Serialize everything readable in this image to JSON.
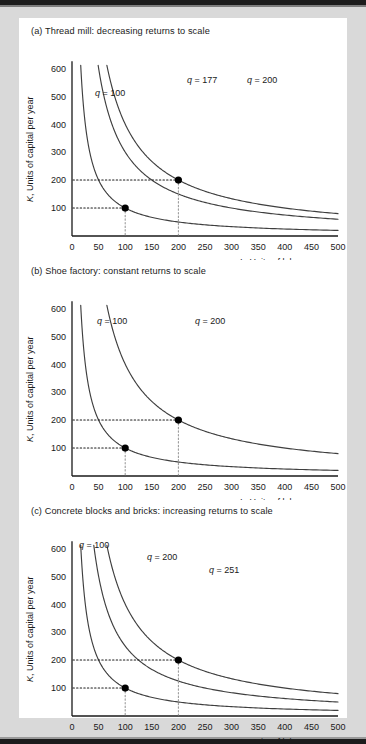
{
  "figure": {
    "background": "#d9d9d9",
    "card_background": "#ffffff",
    "axis_color": "#1a1a1a",
    "curve_color": "#3a3a3a",
    "marker_color": "#000000"
  },
  "axes": {
    "y_label": "K, Units of capital per year",
    "x_label": "L, Units of labor per year",
    "y_ticks": [
      "600",
      "500",
      "400",
      "300",
      "200",
      "100"
    ],
    "x_ticks": [
      "0",
      "50",
      "100",
      "150",
      "200",
      "250",
      "300",
      "350",
      "400",
      "450",
      "500"
    ],
    "xlim": [
      0,
      500
    ],
    "ylim": [
      0,
      640
    ]
  },
  "panels": [
    {
      "id": "a",
      "title": "(a) Thread mill: decreasing returns to scale",
      "curves": [
        {
          "label": "q = 100",
          "q": 100,
          "constant": 10000,
          "lx": 76,
          "ly": 500
        },
        {
          "label": "q = 177",
          "q": 177,
          "constant": 30000,
          "lx": 168,
          "ly": 548
        },
        {
          "label": "q = 200",
          "q": 200,
          "constant": 40000,
          "lx": 228,
          "ly": 548
        }
      ],
      "markers": [
        {
          "x": 100,
          "y": 100
        },
        {
          "x": 200,
          "y": 200
        }
      ]
    },
    {
      "id": "b",
      "title": "(b) Shoe factory: constant returns to scale",
      "curves": [
        {
          "label": "q = 100",
          "q": 100,
          "constant": 10000,
          "lx": 78,
          "ly": 545
        },
        {
          "label": "q = 200",
          "q": 200,
          "constant": 40000,
          "lx": 176,
          "ly": 545
        }
      ],
      "markers": [
        {
          "x": 100,
          "y": 100
        },
        {
          "x": 200,
          "y": 200
        }
      ]
    },
    {
      "id": "c",
      "title": "(c) Concrete blocks and bricks: increasing returns to scale",
      "curves": [
        {
          "label": "q = 100",
          "q": 100,
          "constant": 10000,
          "lx": 60,
          "ly": 600
        },
        {
          "label": "q = 200",
          "q": 200,
          "constant": 25000,
          "lx": 128,
          "ly": 556
        },
        {
          "label": "q = 251",
          "q": 251,
          "constant": 40000,
          "lx": 190,
          "ly": 512
        }
      ],
      "markers": [
        {
          "x": 100,
          "y": 100
        },
        {
          "x": 200,
          "y": 200
        }
      ]
    }
  ],
  "chart_data": {
    "type": "line",
    "xlabel": "L, Units of labor per year",
    "ylabel": "K, Units of capital per year",
    "xlim": [
      0,
      500
    ],
    "ylim": [
      0,
      640
    ],
    "grid": false,
    "legend": "inline curve labels",
    "xticks": [
      0,
      50,
      100,
      150,
      200,
      250,
      300,
      350,
      400,
      450,
      500
    ],
    "yticks": [
      100,
      200,
      300,
      400,
      500,
      600
    ],
    "subplots": [
      {
        "panel": "(a) Thread mill: decreasing returns to scale",
        "series": [
          {
            "name": "q = 100",
            "form": "K = 10000 / L",
            "points_through": [
              [
                100,
                100
              ]
            ]
          },
          {
            "name": "q = 177",
            "form": "K = 30000 / L",
            "points_through": [
              [
                200,
                150
              ]
            ]
          },
          {
            "name": "q = 200",
            "form": "K = 40000 / L",
            "points_through": [
              [
                200,
                200
              ]
            ]
          }
        ],
        "annotated_points": [
          [
            100,
            100
          ],
          [
            200,
            200
          ]
        ]
      },
      {
        "panel": "(b) Shoe factory: constant returns to scale",
        "series": [
          {
            "name": "q = 100",
            "form": "K = 10000 / L",
            "points_through": [
              [
                100,
                100
              ]
            ]
          },
          {
            "name": "q = 200",
            "form": "K = 40000 / L",
            "points_through": [
              [
                200,
                200
              ]
            ]
          }
        ],
        "annotated_points": [
          [
            100,
            100
          ],
          [
            200,
            200
          ]
        ]
      },
      {
        "panel": "(c) Concrete blocks and bricks: increasing returns to scale",
        "series": [
          {
            "name": "q = 100",
            "form": "K = 10000 / L",
            "points_through": [
              [
                100,
                100
              ]
            ]
          },
          {
            "name": "q = 200",
            "form": "K = 25000 / L",
            "points_through": [
              [
                200,
                125
              ]
            ]
          },
          {
            "name": "q = 251",
            "form": "K = 40000 / L",
            "points_through": [
              [
                200,
                200
              ]
            ]
          }
        ],
        "annotated_points": [
          [
            100,
            100
          ],
          [
            200,
            200
          ]
        ]
      }
    ]
  }
}
